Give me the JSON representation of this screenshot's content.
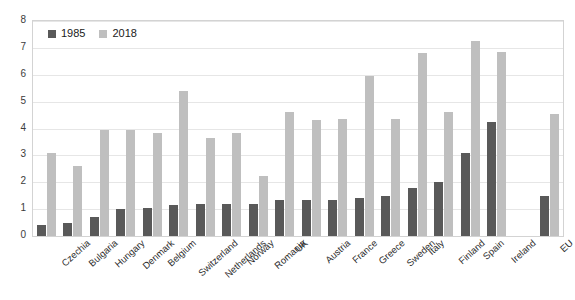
{
  "chart_data": {
    "type": "bar",
    "title": "",
    "subtitle": "",
    "xlabel": "",
    "ylabel": "",
    "ylim": [
      0,
      8
    ],
    "yticks": [
      0,
      1,
      2,
      3,
      4,
      5,
      6,
      7,
      8
    ],
    "grid": true,
    "legend_position": "top-left",
    "categories": [
      "Czechia",
      "Bulgaria",
      "Hungary",
      "Denmark",
      "Belgium",
      "Switzerland",
      "Netherlands",
      "Norway",
      "Romania",
      "UK",
      "Austria",
      "France",
      "Greece",
      "Sweden",
      "Italy",
      "Finland",
      "Spain",
      "Ireland",
      "EU"
    ],
    "series": [
      {
        "name": "1985",
        "color": "#595959",
        "values": [
          0.4,
          0.5,
          0.7,
          1.0,
          1.05,
          1.15,
          1.2,
          1.2,
          1.2,
          1.35,
          1.35,
          1.35,
          1.4,
          1.5,
          1.8,
          2.0,
          3.1,
          4.25,
          1.5
        ]
      },
      {
        "name": "2018",
        "color": "#bfbfbf",
        "values": [
          3.1,
          2.6,
          3.95,
          3.95,
          3.85,
          5.4,
          3.65,
          3.85,
          2.25,
          4.6,
          4.3,
          4.35,
          5.95,
          4.35,
          6.8,
          4.6,
          7.25,
          6.85,
          4.55
        ]
      }
    ],
    "gap_before_last_category": true
  },
  "legend": {
    "items": [
      {
        "label": "1985",
        "color": "#595959"
      },
      {
        "label": "2018",
        "color": "#bfbfbf"
      }
    ]
  },
  "axis": {
    "y_tick_labels": [
      "8",
      "7",
      "6",
      "5",
      "4",
      "3",
      "2",
      "1",
      "0"
    ]
  },
  "colors": {
    "series_1985": "#595959",
    "series_2018": "#bfbfbf",
    "gridline": "#e6e6e6",
    "border": "#d3d3d3",
    "background": "#ffffff",
    "text": "#2b2b2b"
  }
}
